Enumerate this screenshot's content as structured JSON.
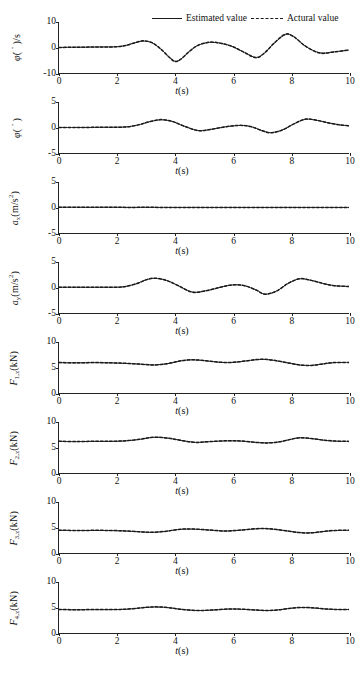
{
  "legend": {
    "estimated_label": "Estimated value",
    "actual_label": "Actural value",
    "estimated_style": "solid",
    "actual_style": "dashed",
    "color": "#1a1a1a"
  },
  "axis": {
    "xlabel_symbol": "t",
    "xlabel_unit": "(s)",
    "xticks": [
      0,
      2,
      4,
      6,
      8,
      10
    ],
    "xlim": [
      0,
      10
    ]
  },
  "chart_data": [
    {
      "type": "line",
      "id": "roll-rate",
      "ylabel_main": "φ̇(",
      "ylabel_symbol": "φ",
      "ylabel_unit": "(°)/s",
      "ylabel_full": "φ̇(°)/s",
      "ylim": [
        -10,
        10
      ],
      "yticks": [
        -10,
        0,
        10
      ],
      "xlabel": "t(s)",
      "xlim": [
        0,
        10
      ],
      "grid": false,
      "series": [
        {
          "name": "Estimated value",
          "style": "solid",
          "x": [
            0,
            0.5,
            1,
            1.5,
            2,
            2.3,
            2.6,
            2.9,
            3.2,
            3.5,
            3.8,
            4,
            4.2,
            4.5,
            4.8,
            5.2,
            5.6,
            6,
            6.4,
            6.8,
            7.1,
            7.4,
            7.8,
            8.1,
            8.5,
            9,
            9.5,
            10
          ],
          "y": [
            0,
            0.1,
            0.15,
            0.2,
            0.3,
            0.8,
            1.8,
            2.5,
            1.9,
            -0.5,
            -3.8,
            -5.4,
            -4.6,
            -1.5,
            0.9,
            2.0,
            1.6,
            0.3,
            -2.0,
            -3.9,
            -2.0,
            1.5,
            5.0,
            4.2,
            0.5,
            -2.1,
            -1.7,
            -1.0
          ]
        },
        {
          "name": "Actural value",
          "style": "dashed",
          "x": [
            0,
            0.5,
            1,
            1.5,
            2,
            2.3,
            2.6,
            2.9,
            3.2,
            3.5,
            3.8,
            4,
            4.2,
            4.5,
            4.8,
            5.2,
            5.6,
            6,
            6.4,
            6.8,
            7.1,
            7.4,
            7.8,
            8.1,
            8.5,
            9,
            9.5,
            10
          ],
          "y": [
            0,
            0.1,
            0.15,
            0.2,
            0.3,
            0.8,
            1.8,
            2.6,
            1.9,
            -0.5,
            -3.8,
            -5.5,
            -4.6,
            -1.5,
            0.9,
            2.1,
            1.6,
            0.3,
            -2.0,
            -4.0,
            -2.0,
            1.5,
            5.2,
            4.2,
            0.5,
            -2.2,
            -1.7,
            -1.0
          ]
        }
      ]
    },
    {
      "type": "line",
      "id": "roll-angle",
      "ylabel_symbol": "φ",
      "ylabel_unit": "(°)",
      "ylabel_full": "φ(°)",
      "ylim": [
        -5,
        5
      ],
      "yticks": [
        -5,
        0,
        5
      ],
      "xlabel": "t(s)",
      "xlim": [
        0,
        10
      ],
      "grid": false,
      "series": [
        {
          "name": "Estimated value",
          "style": "solid",
          "x": [
            0,
            0.5,
            1,
            1.5,
            2,
            2.4,
            2.8,
            3.1,
            3.5,
            3.9,
            4.3,
            4.8,
            5.2,
            5.7,
            6.2,
            6.6,
            7.0,
            7.3,
            7.7,
            8.1,
            8.5,
            8.9,
            9.3,
            9.7,
            10
          ],
          "y": [
            0,
            0,
            0.02,
            0.04,
            0.06,
            0.15,
            0.6,
            1.1,
            1.5,
            1.2,
            0.3,
            -0.6,
            -0.4,
            0.1,
            0.4,
            0.2,
            -0.6,
            -1.0,
            -0.5,
            0.7,
            1.6,
            1.4,
            0.9,
            0.5,
            0.35
          ]
        },
        {
          "name": "Actural value",
          "style": "dashed",
          "x": [
            0,
            0.5,
            1,
            1.5,
            2,
            2.4,
            2.8,
            3.1,
            3.5,
            3.9,
            4.3,
            4.8,
            5.2,
            5.7,
            6.2,
            6.6,
            7.0,
            7.3,
            7.7,
            8.1,
            8.5,
            8.9,
            9.3,
            9.7,
            10
          ],
          "y": [
            0,
            0,
            0.02,
            0.04,
            0.06,
            0.15,
            0.6,
            1.1,
            1.55,
            1.2,
            0.3,
            -0.62,
            -0.4,
            0.1,
            0.42,
            0.2,
            -0.62,
            -1.05,
            -0.5,
            0.72,
            1.65,
            1.4,
            0.9,
            0.5,
            0.35
          ]
        }
      ]
    },
    {
      "type": "line",
      "id": "accel-x",
      "ylabel_symbol": "a",
      "ylabel_sub": "x",
      "ylabel_unit": "(m/s²)",
      "ylabel_full": "a_x(m/s²)",
      "ylim": [
        -5,
        5
      ],
      "yticks": [
        -5,
        0,
        5
      ],
      "xlabel": "t(s)",
      "xlim": [
        0,
        10
      ],
      "grid": false,
      "series": [
        {
          "name": "Estimated value",
          "style": "solid",
          "x": [
            0,
            0.6,
            1.2,
            1.8,
            2.4,
            3,
            3.6,
            4.2,
            4.8,
            5.4,
            6,
            6.6,
            7.2,
            7.8,
            8.4,
            9,
            9.6,
            10
          ],
          "y": [
            0.05,
            0.04,
            0.03,
            0.05,
            0.02,
            0.03,
            0.02,
            0.01,
            0.02,
            0.01,
            0.02,
            0.01,
            0.01,
            0.02,
            0.01,
            0.01,
            0.01,
            0.01
          ]
        },
        {
          "name": "Actural value",
          "style": "dashed",
          "x": [
            0,
            0.6,
            1.2,
            1.8,
            2.4,
            3,
            3.6,
            4.2,
            4.8,
            5.4,
            6,
            6.6,
            7.2,
            7.8,
            8.4,
            9,
            9.6,
            10
          ],
          "y": [
            0.05,
            0.04,
            0.03,
            0.05,
            0.02,
            0.03,
            0.02,
            0.01,
            0.02,
            0.01,
            0.02,
            0.01,
            0.01,
            0.02,
            0.01,
            0.01,
            0.01,
            0.01
          ]
        }
      ]
    },
    {
      "type": "line",
      "id": "accel-y",
      "ylabel_symbol": "a",
      "ylabel_sub": "y",
      "ylabel_unit": "(m/s²)",
      "ylabel_full": "a_y(m/s²)",
      "ylim": [
        -5,
        5
      ],
      "yticks": [
        -5,
        0,
        5
      ],
      "xlabel": "t(s)",
      "xlim": [
        0,
        10
      ],
      "grid": false,
      "series": [
        {
          "name": "Estimated value",
          "style": "solid",
          "x": [
            0,
            0.5,
            1,
            1.5,
            2,
            2.3,
            2.7,
            3,
            3.3,
            3.7,
            4.1,
            4.6,
            5.1,
            5.6,
            6.0,
            6.4,
            6.8,
            7.1,
            7.5,
            7.9,
            8.3,
            8.7,
            9.1,
            9.5,
            10
          ],
          "y": [
            0.05,
            0.05,
            0.04,
            0.05,
            0.06,
            0.2,
            0.8,
            1.5,
            1.8,
            1.4,
            0.4,
            -0.9,
            -0.6,
            0.1,
            0.5,
            0.35,
            -0.5,
            -1.3,
            -0.7,
            0.8,
            1.7,
            1.4,
            0.8,
            0.35,
            0.2
          ]
        },
        {
          "name": "Actural value",
          "style": "dashed",
          "x": [
            0,
            0.5,
            1,
            1.5,
            2,
            2.3,
            2.7,
            3,
            3.3,
            3.7,
            4.1,
            4.6,
            5.1,
            5.6,
            6.0,
            6.4,
            6.8,
            7.1,
            7.5,
            7.9,
            8.3,
            8.7,
            9.1,
            9.5,
            10
          ],
          "y": [
            0.05,
            0.05,
            0.04,
            0.05,
            0.06,
            0.2,
            0.8,
            1.5,
            1.82,
            1.4,
            0.4,
            -0.92,
            -0.6,
            0.1,
            0.52,
            0.35,
            -0.5,
            -1.32,
            -0.7,
            0.8,
            1.72,
            1.4,
            0.8,
            0.35,
            0.2
          ]
        }
      ]
    },
    {
      "type": "line",
      "id": "force-1z",
      "ylabel_symbol": "F",
      "ylabel_sub": "1,z",
      "ylabel_unit": "(kN)",
      "ylabel_full": "F_1,z(kN)",
      "ylim": [
        0,
        10
      ],
      "yticks": [
        0,
        5,
        10
      ],
      "xlabel": "t(s)",
      "xlim": [
        0,
        10
      ],
      "grid": false,
      "series": [
        {
          "name": "Estimated value",
          "style": "solid",
          "x": [
            0,
            0.6,
            1.2,
            1.8,
            2.3,
            2.8,
            3.3,
            3.8,
            4.2,
            4.6,
            5.0,
            5.4,
            5.8,
            6.2,
            6.6,
            7.0,
            7.4,
            7.9,
            8.3,
            8.7,
            9.1,
            9.5,
            10
          ],
          "y": [
            5.95,
            5.9,
            5.95,
            5.9,
            5.8,
            5.65,
            5.5,
            5.8,
            6.3,
            6.5,
            6.35,
            6.1,
            5.95,
            6.1,
            6.4,
            6.6,
            6.4,
            5.9,
            5.5,
            5.4,
            5.7,
            5.95,
            6.0
          ]
        },
        {
          "name": "Actural value",
          "style": "dashed",
          "x": [
            0,
            0.6,
            1.2,
            1.8,
            2.3,
            2.8,
            3.3,
            3.8,
            4.2,
            4.6,
            5.0,
            5.4,
            5.8,
            6.2,
            6.6,
            7.0,
            7.4,
            7.9,
            8.3,
            8.7,
            9.1,
            9.5,
            10
          ],
          "y": [
            5.98,
            5.92,
            5.97,
            5.92,
            5.82,
            5.66,
            5.5,
            5.82,
            6.32,
            6.52,
            6.36,
            6.12,
            5.96,
            6.12,
            6.42,
            6.62,
            6.42,
            5.9,
            5.5,
            5.4,
            5.72,
            5.97,
            6.0
          ]
        }
      ]
    },
    {
      "type": "line",
      "id": "force-2z",
      "ylabel_symbol": "F",
      "ylabel_sub": "2,z",
      "ylabel_unit": "(kN)",
      "ylabel_full": "F_2,z(kN)",
      "ylim": [
        0,
        10
      ],
      "yticks": [
        0,
        5,
        10
      ],
      "xlabel": "t(s)",
      "xlim": [
        0,
        10
      ],
      "grid": false,
      "series": [
        {
          "name": "Estimated value",
          "style": "solid",
          "x": [
            0,
            0.6,
            1.2,
            1.8,
            2.3,
            2.8,
            3.1,
            3.4,
            3.8,
            4.2,
            4.7,
            5.2,
            5.8,
            6.3,
            6.8,
            7.2,
            7.6,
            8.0,
            8.3,
            8.7,
            9.1,
            9.5,
            10
          ],
          "y": [
            6.2,
            6.15,
            6.2,
            6.2,
            6.3,
            6.6,
            6.9,
            7.0,
            6.8,
            6.4,
            6.0,
            6.15,
            6.3,
            6.25,
            6.0,
            5.9,
            6.1,
            6.6,
            6.9,
            6.75,
            6.45,
            6.25,
            6.2
          ]
        },
        {
          "name": "Actural value",
          "style": "dashed",
          "x": [
            0,
            0.6,
            1.2,
            1.8,
            2.3,
            2.8,
            3.1,
            3.4,
            3.8,
            4.2,
            4.7,
            5.2,
            5.8,
            6.3,
            6.8,
            7.2,
            7.6,
            8.0,
            8.3,
            8.7,
            9.1,
            9.5,
            10
          ],
          "y": [
            6.22,
            6.17,
            6.22,
            6.22,
            6.32,
            6.62,
            6.92,
            7.02,
            6.82,
            6.4,
            6.0,
            6.17,
            6.32,
            6.27,
            6.0,
            5.9,
            6.12,
            6.62,
            6.92,
            6.77,
            6.47,
            6.27,
            6.2
          ]
        }
      ]
    },
    {
      "type": "line",
      "id": "force-3z",
      "ylabel_symbol": "F",
      "ylabel_sub": "3,z",
      "ylabel_unit": "(kN)",
      "ylabel_full": "F_3,z(kN)",
      "ylim": [
        0,
        10
      ],
      "yticks": [
        0,
        5,
        10
      ],
      "xlabel": "t(s)",
      "xlim": [
        0,
        10
      ],
      "grid": false,
      "series": [
        {
          "name": "Estimated value",
          "style": "solid",
          "x": [
            0,
            0.6,
            1.2,
            1.8,
            2.3,
            2.8,
            3.2,
            3.7,
            4.1,
            4.5,
            4.9,
            5.3,
            5.7,
            6.1,
            6.5,
            7.0,
            7.4,
            7.9,
            8.3,
            8.7,
            9.1,
            9.5,
            10
          ],
          "y": [
            4.45,
            4.4,
            4.42,
            4.4,
            4.3,
            4.15,
            4.05,
            4.25,
            4.6,
            4.7,
            4.6,
            4.45,
            4.3,
            4.4,
            4.6,
            4.8,
            4.65,
            4.3,
            4.0,
            3.95,
            4.2,
            4.4,
            4.45
          ]
        },
        {
          "name": "Actural value",
          "style": "dashed",
          "x": [
            0,
            0.6,
            1.2,
            1.8,
            2.3,
            2.8,
            3.2,
            3.7,
            4.1,
            4.5,
            4.9,
            5.3,
            5.7,
            6.1,
            6.5,
            7.0,
            7.4,
            7.9,
            8.3,
            8.7,
            9.1,
            9.5,
            10
          ],
          "y": [
            4.47,
            4.42,
            4.44,
            4.42,
            4.32,
            4.16,
            4.05,
            4.27,
            4.62,
            4.72,
            4.62,
            4.47,
            4.32,
            4.42,
            4.62,
            4.82,
            4.67,
            4.3,
            4.0,
            3.95,
            4.22,
            4.42,
            4.45
          ]
        }
      ]
    },
    {
      "type": "line",
      "id": "force-4z",
      "ylabel_symbol": "F",
      "ylabel_sub": "4,z",
      "ylabel_unit": "(kN)",
      "ylabel_full": "F_4,z(kN)",
      "ylim": [
        0,
        10
      ],
      "yticks": [
        0,
        5,
        10
      ],
      "xlabel": "t(s)",
      "xlim": [
        0,
        10
      ],
      "grid": false,
      "series": [
        {
          "name": "Estimated value",
          "style": "solid",
          "x": [
            0,
            0.6,
            1.2,
            1.8,
            2.3,
            2.8,
            3.1,
            3.4,
            3.8,
            4.2,
            4.8,
            5.3,
            5.9,
            6.3,
            6.8,
            7.2,
            7.6,
            8.0,
            8.4,
            8.8,
            9.2,
            9.6,
            10
          ],
          "y": [
            4.6,
            4.55,
            4.58,
            4.58,
            4.65,
            4.9,
            5.05,
            5.1,
            4.95,
            4.65,
            4.4,
            4.5,
            4.7,
            4.65,
            4.5,
            4.4,
            4.55,
            4.85,
            5.0,
            4.9,
            4.7,
            4.6,
            4.6
          ]
        },
        {
          "name": "Actural value",
          "style": "dashed",
          "x": [
            0,
            0.6,
            1.2,
            1.8,
            2.3,
            2.8,
            3.1,
            3.4,
            3.8,
            4.2,
            4.8,
            5.3,
            5.9,
            6.3,
            6.8,
            7.2,
            7.6,
            8.0,
            8.4,
            8.8,
            9.2,
            9.6,
            10
          ],
          "y": [
            4.62,
            4.57,
            4.6,
            4.6,
            4.67,
            4.92,
            5.07,
            5.12,
            4.97,
            4.65,
            4.4,
            4.52,
            4.72,
            4.67,
            4.5,
            4.4,
            4.57,
            4.87,
            5.02,
            4.92,
            4.72,
            4.6,
            4.6
          ]
        }
      ]
    }
  ]
}
